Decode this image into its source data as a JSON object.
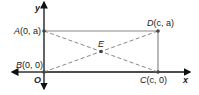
{
  "diagram": {
    "type": "coordinate-geometry",
    "axes": {
      "x_label": "x",
      "y_label": "y",
      "origin_label": "O"
    },
    "points": [
      {
        "id": "A",
        "name": "A",
        "coords": "(0, a)"
      },
      {
        "id": "B",
        "name": "B",
        "coords": "(0, 0)"
      },
      {
        "id": "C",
        "name": "C",
        "coords": "(c, 0)"
      },
      {
        "id": "D",
        "name": "D",
        "coords": "(c, a)"
      },
      {
        "id": "E",
        "name": "E",
        "coords": ""
      }
    ],
    "segments": [
      {
        "from": "A",
        "to": "D",
        "style": "solid"
      },
      {
        "from": "D",
        "to": "C",
        "style": "solid"
      },
      {
        "from": "A",
        "to": "C",
        "style": "dashed"
      },
      {
        "from": "B",
        "to": "D",
        "style": "dashed"
      }
    ],
    "colors": {
      "axis": "#111111",
      "rect": "#888888",
      "diagonal": "#888888",
      "point": "#444444"
    }
  }
}
